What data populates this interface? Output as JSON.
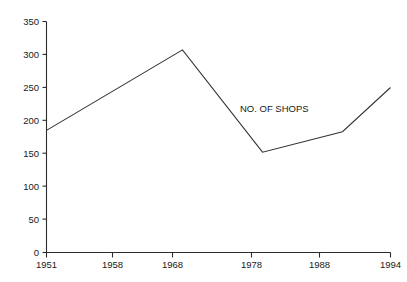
{
  "chart_data": {
    "type": "line",
    "title": "",
    "xlabel": "",
    "ylabel": "",
    "x": [
      1951,
      1958,
      1968,
      1978,
      1988,
      1994
    ],
    "categories": [
      "1951",
      "1958",
      "1968",
      "1978",
      "1988",
      "1994"
    ],
    "values": [
      185,
      230,
      307,
      152,
      183,
      250
    ],
    "series": [
      {
        "name": "NO. OF SHOPS",
        "values": [
          185,
          230,
          307,
          152,
          183,
          250
        ]
      }
    ],
    "vertices": [
      {
        "x": 1951,
        "y": 185
      },
      {
        "x": 1968,
        "y": 307
      },
      {
        "x": 1978,
        "y": 152
      },
      {
        "x": 1988,
        "y": 183
      },
      {
        "x": 1994,
        "y": 250
      }
    ],
    "ylim": [
      0,
      350
    ],
    "xlim": [
      1951,
      1994
    ],
    "yticks": [
      0,
      50,
      100,
      150,
      200,
      250,
      300,
      350
    ],
    "ytick_labels": [
      "0",
      "50",
      "100",
      "150",
      "200",
      "250",
      "300",
      "350"
    ],
    "xticks": [
      1951,
      1958,
      1968,
      1978,
      1988,
      1994
    ],
    "xtick_labels": [
      "1951",
      "1958",
      "1968",
      "1978",
      "1988",
      "1994"
    ],
    "grid": false,
    "legend": "none",
    "annotations": [
      {
        "text": "NO. OF SHOPS",
        "x": 1978,
        "y": 215
      }
    ],
    "line_color": "#333333",
    "axis_color": "#2b2b2b",
    "background_color": "#ffffff"
  },
  "labels": {
    "y": [
      "350",
      "300",
      "250",
      "200",
      "150",
      "100",
      "50",
      "0"
    ],
    "x": [
      "1951",
      "1958",
      "1968",
      "1978",
      "1988",
      "1994"
    ],
    "annotation": "NO. OF SHOPS"
  }
}
